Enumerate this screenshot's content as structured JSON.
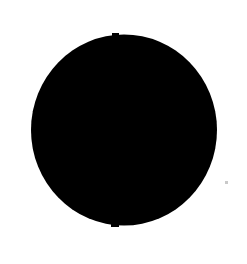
{
  "canvas": {
    "width": 247,
    "height": 264,
    "background_color": "#ffffff",
    "description": "Solid black filled circle on a plain white background"
  },
  "figure": {
    "name": "black-disc",
    "shape_type": "circle",
    "fill_color": "#000000",
    "stroke_color": "none",
    "center_x": 124,
    "center_y": 130,
    "radius_x": 93,
    "radius_y": 95.5,
    "bounds": {
      "left": 31,
      "top": 35,
      "right": 217,
      "bottom": 226,
      "width": 186,
      "height": 191
    },
    "edge_quality": "slightly irregular, scanned / printed appearance with soft antialiased rim"
  },
  "artifacts": [
    {
      "name": "top-nub",
      "shape_type": "rect",
      "x": 112,
      "y": 33,
      "width": 7,
      "height": 3,
      "color": "#000000"
    },
    {
      "name": "bottom-nub",
      "shape_type": "rect",
      "x": 111,
      "y": 224,
      "width": 8,
      "height": 3,
      "color": "#000000"
    },
    {
      "name": "speck",
      "shape_type": "rect",
      "x": 225,
      "y": 181,
      "width": 3,
      "height": 3,
      "color": "#c9c9c9"
    }
  ],
  "labels": {
    "alt_text": "A large solid black circle centered on a white page"
  }
}
